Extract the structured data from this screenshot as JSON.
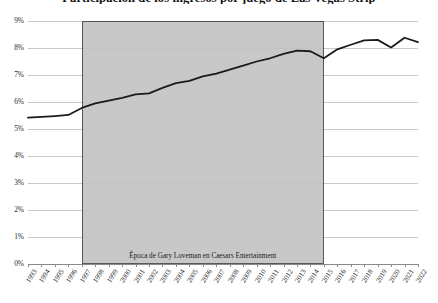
{
  "chart_data": {
    "type": "line",
    "title": "Participación de los ingresos por juego de Las Vegas Strip",
    "xlabel": "",
    "ylabel": "",
    "ylim": [
      0,
      9
    ],
    "ytick_labels": [
      "0%",
      "1%",
      "2%",
      "3%",
      "4%",
      "5%",
      "6%",
      "7%",
      "8%",
      "9%"
    ],
    "ytick_values": [
      0,
      1,
      2,
      3,
      4,
      5,
      6,
      7,
      8,
      9
    ],
    "grid": true,
    "legend": "none",
    "categories": [
      "1993",
      "1994",
      "1995",
      "1996",
      "1997",
      "1998",
      "1999",
      "2000",
      "2001",
      "2002",
      "2003",
      "2004",
      "2005",
      "2006",
      "2007",
      "2008",
      "2009",
      "2010",
      "2011",
      "2012",
      "2013",
      "2014",
      "2015",
      "2016",
      "2017",
      "2018",
      "2019",
      "2020",
      "2021",
      "2022"
    ],
    "values": [
      5.42,
      5.45,
      5.48,
      5.52,
      5.78,
      5.95,
      6.05,
      6.15,
      6.28,
      6.32,
      6.52,
      6.7,
      6.78,
      6.95,
      7.05,
      7.2,
      7.35,
      7.5,
      7.62,
      7.78,
      7.9,
      7.88,
      7.62,
      7.95,
      8.12,
      8.28,
      8.3,
      8.02,
      8.38,
      8.22
    ],
    "series_color": "#1a1a1a",
    "annotations": [
      {
        "text": "Época de Gary Loveman en Caesars Entertainment",
        "type": "shaded-band",
        "x_start": "1997",
        "x_end": "2015",
        "band_color": "#c4c4c4",
        "band_border_color": "#4a4a4a"
      }
    ]
  }
}
